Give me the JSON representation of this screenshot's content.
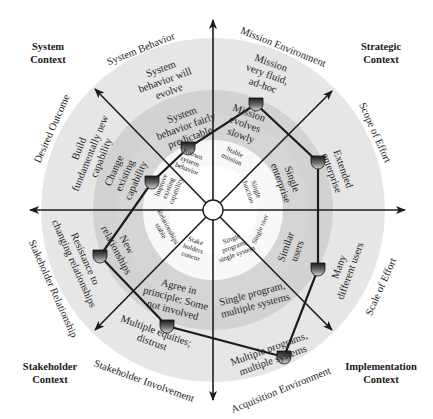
{
  "contexts": {
    "system": {
      "line1": "System",
      "line2": "Context"
    },
    "strategic": {
      "line1": "Strategic",
      "line2": "Context"
    },
    "stakeholder": {
      "line1": "Stakeholder",
      "line2": "Context"
    },
    "implementation": {
      "line1": "Implementation",
      "line2": "Context"
    }
  },
  "axes": [
    {
      "id": "system-behavior",
      "label": "System Behavior"
    },
    {
      "id": "mission-environment",
      "label": "Mission Environment"
    },
    {
      "id": "scope-of-effort",
      "label": "Scope of Effort"
    },
    {
      "id": "scale-of-effort",
      "label": "Scale of Effort"
    },
    {
      "id": "acquisition-environment",
      "label": "Acquisition Environment"
    },
    {
      "id": "stakeholder-involvement",
      "label": "Stakeholder Involvement"
    },
    {
      "id": "stakeholder-relationship",
      "label": "Stakeholder Relationship"
    },
    {
      "id": "desired-outcome",
      "label": "Desired Outcome"
    }
  ],
  "inner_ring": {
    "system_behavior": [
      "Known",
      "system",
      "behavior"
    ],
    "mission": [
      "Stable",
      "mission"
    ],
    "scope": [
      "Single",
      "function"
    ],
    "scale": [
      "Single user"
    ],
    "acquisition": [
      "Single",
      "program,",
      "single system"
    ],
    "involvement": [
      "Stake",
      "holders",
      "concur"
    ],
    "relationship": [
      "Relationships",
      "stable"
    ],
    "outcome": [
      "Improve",
      "existing",
      "capability"
    ]
  },
  "middle_ring": {
    "system_behavior": [
      "System",
      "behavior fairly",
      "predictable"
    ],
    "mission": [
      "Mission",
      "evolves",
      "slowly"
    ],
    "scope": [
      "Single",
      "enterprise"
    ],
    "scale": [
      "Similar",
      "users"
    ],
    "acquisition": [
      "Single program,",
      "multiple systems"
    ],
    "involvement": [
      "Agree in",
      "principle; Some",
      "not involved"
    ],
    "relationship": [
      "New",
      "relationships"
    ],
    "outcome": [
      "Change",
      "existing",
      "capability"
    ]
  },
  "outer_ring": {
    "system_behavior": [
      "System",
      "behavior will",
      "evolve"
    ],
    "mission": [
      "Mission",
      "very fluid,",
      "ad-hoc"
    ],
    "scope": [
      "Extended",
      "enterprise"
    ],
    "scale": [
      "Many",
      "different users"
    ],
    "acquisition": [
      "Multiple programs,",
      "multiple systems"
    ],
    "involvement": [
      "Multiple equities;",
      "distrust"
    ],
    "relationship": [
      "Resistance to",
      "changing relationships"
    ],
    "outcome": [
      "Build",
      "fundamentally new",
      "capability"
    ]
  },
  "profile_markers": [
    {
      "dimension": "Mission Environment",
      "value": "Mission very fluid, ad-hoc"
    },
    {
      "dimension": "Scope of Effort",
      "value": "Extended enterprise"
    },
    {
      "dimension": "Scale of Effort",
      "value": "Many different users"
    },
    {
      "dimension": "Acquisition Environment",
      "value": "Multiple programs, multiple systems"
    },
    {
      "dimension": "Stakeholder Involvement",
      "value": "Multiple equities; distrust"
    },
    {
      "dimension": "Stakeholder Relationship",
      "value": "Resistance to changing relationships"
    },
    {
      "dimension": "Desired Outcome",
      "value": "Change existing capability"
    },
    {
      "dimension": "System Behavior",
      "value": "Known system behavior"
    }
  ],
  "colors": {
    "outer_ring": "#e4e4e4",
    "middle_ring": "#cfcfcf",
    "inner_ring": "#f7f7f7",
    "line": "#1c1c1c"
  }
}
